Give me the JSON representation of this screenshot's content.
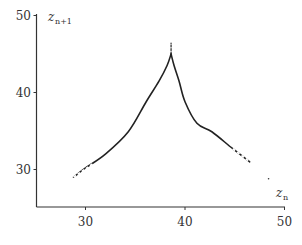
{
  "chart_data": {
    "type": "line",
    "title": "",
    "xlabel": "z_n",
    "ylabel": "z_{n+1}",
    "xlabel_parts": {
      "base": "z",
      "sub": "n"
    },
    "ylabel_parts": {
      "base": "z",
      "sub": "n+1"
    },
    "xlim": [
      25,
      50
    ],
    "ylim": [
      25,
      50
    ],
    "x_ticks": [
      30,
      40,
      50
    ],
    "y_ticks": [
      30,
      40,
      50
    ],
    "x_tick_labels": [
      "30",
      "40",
      "50"
    ],
    "y_tick_labels": [
      "30",
      "40",
      "50"
    ],
    "grid": false,
    "legend": null,
    "series": [
      {
        "name": "return map (left branch, increasing)",
        "x": [
          28.8,
          30.0,
          32.0,
          34.3,
          36.1,
          37.4,
          38.2,
          38.6
        ],
        "y": [
          29.0,
          30.2,
          32.0,
          34.9,
          38.8,
          41.5,
          43.5,
          45.0
        ]
      },
      {
        "name": "return map (right branch, decreasing)",
        "x": [
          38.6,
          38.9,
          39.4,
          40.0,
          41.2,
          42.7,
          44.8,
          46.5
        ],
        "y": [
          45.0,
          43.5,
          41.5,
          38.8,
          36.0,
          34.9,
          32.7,
          31.0
        ]
      },
      {
        "name": "cusp tip (sparse points)",
        "x": [
          38.6,
          38.6
        ],
        "y": [
          45.0,
          46.4
        ]
      },
      {
        "name": "isolated point",
        "x": [
          48.4
        ],
        "y": [
          28.8
        ]
      }
    ]
  }
}
